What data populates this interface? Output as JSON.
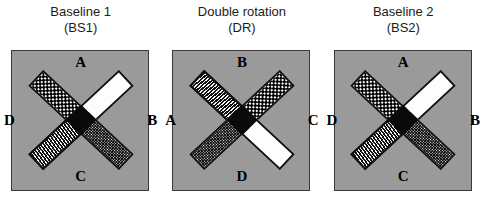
{
  "figure": {
    "background_color": "#ffffff",
    "panel_fill_color": "#9a9a9a",
    "panel_border_color": "#3a3a3a",
    "cross_outline_color": "#111111",
    "cross_hub_color": "#0a0a0a"
  },
  "panels": [
    {
      "id": "baseline-1",
      "title_line1": "Baseline 1",
      "title_line2": "(BS1)",
      "labels": {
        "top": "A",
        "right": "B",
        "bottom": "C",
        "left": "D"
      },
      "arms": [
        {
          "position": "upper-left",
          "pattern": "dots"
        },
        {
          "position": "upper-right",
          "pattern": "white"
        },
        {
          "position": "lower-right",
          "pattern": "speckle"
        },
        {
          "position": "lower-left",
          "pattern": "lines"
        }
      ]
    },
    {
      "id": "double-rotation",
      "title_line1": "Double rotation",
      "title_line2": "(DR)",
      "labels": {
        "top": "B",
        "right": "C",
        "bottom": "D",
        "left": "A"
      },
      "arms": [
        {
          "position": "upper-left",
          "pattern": "lines"
        },
        {
          "position": "upper-right",
          "pattern": "dots"
        },
        {
          "position": "lower-right",
          "pattern": "white"
        },
        {
          "position": "lower-left",
          "pattern": "speckle"
        }
      ]
    },
    {
      "id": "baseline-2",
      "title_line1": "Baseline 2",
      "title_line2": "(BS2)",
      "labels": {
        "top": "A",
        "right": "B",
        "bottom": "C",
        "left": "D"
      },
      "arms": [
        {
          "position": "upper-left",
          "pattern": "dots"
        },
        {
          "position": "upper-right",
          "pattern": "white"
        },
        {
          "position": "lower-right",
          "pattern": "speckle"
        },
        {
          "position": "lower-left",
          "pattern": "lines"
        }
      ]
    }
  ]
}
